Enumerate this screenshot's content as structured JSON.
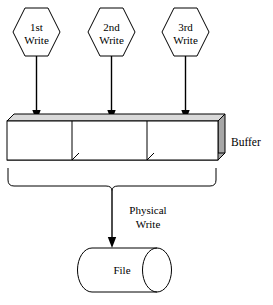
{
  "diagram": {
    "colors": {
      "stroke": "#000000",
      "background": "#ffffff",
      "box_top_face": "#d9d9d9",
      "box_side_face": "#a6a6a6"
    },
    "writes": [
      {
        "id": "write-1",
        "line1": "1st",
        "line2": "Write"
      },
      {
        "id": "write-2",
        "line1": "2nd",
        "line2": "Write"
      },
      {
        "id": "write-3",
        "line1": "3rd",
        "line2": "Write"
      }
    ],
    "buffer": {
      "label": "Buffer",
      "slots": 3
    },
    "physical_write": {
      "line1": "Physical",
      "line2": "Write"
    },
    "file": {
      "label": "File"
    }
  }
}
